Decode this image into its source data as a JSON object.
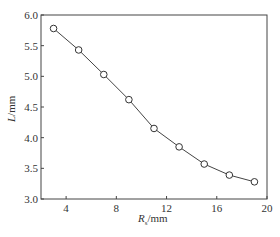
{
  "chart_data": {
    "type": "line",
    "title": "",
    "xlabel": "R_s/mm",
    "xlabel_main": "R",
    "xlabel_sub": "s",
    "xlabel_unit": "/mm",
    "ylabel": "L/mm",
    "ylabel_main": "L",
    "ylabel_unit": "/mm",
    "xlim": [
      2,
      20
    ],
    "ylim": [
      3.0,
      6.0
    ],
    "xticks": [
      "4",
      "8",
      "12",
      "16",
      "20"
    ],
    "yticks": [
      "3.0",
      "3.5",
      "4.0",
      "4.5",
      "5.0",
      "5.5",
      "6.0"
    ],
    "grid": false,
    "marker": "open-circle",
    "series": [
      {
        "name": "L",
        "x": [
          3,
          5,
          7,
          9,
          11,
          13,
          15,
          17,
          19
        ],
        "y": [
          5.78,
          5.43,
          5.03,
          4.62,
          4.15,
          3.85,
          3.57,
          3.39,
          3.28
        ]
      }
    ]
  }
}
